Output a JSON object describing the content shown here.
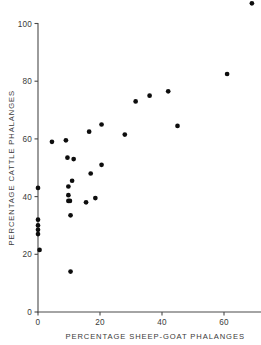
{
  "chart_data": {
    "type": "scatter",
    "title": "",
    "xlabel": "PERCENTAGE SHEEP-GOAT PHALANGES",
    "ylabel": "PERCENTAGE CATTLE PHALANGES",
    "xlim": [
      0,
      73
    ],
    "ylim": [
      0,
      110
    ],
    "xticks": [
      0,
      20,
      40,
      60
    ],
    "yticks": [
      0,
      20,
      40,
      60,
      80,
      100
    ],
    "xticklabels": [
      "0",
      "20",
      "40",
      "60"
    ],
    "yticklabels": [
      "0",
      "20",
      "40",
      "60",
      "80",
      "100"
    ],
    "grid": false,
    "legend": null,
    "marker": "filled-circle",
    "marker_color": "#0d0d0d",
    "points": [
      {
        "x": 0.0,
        "y": 43.0
      },
      {
        "x": 0.0,
        "y": 32.0
      },
      {
        "x": 0.0,
        "y": 30.0
      },
      {
        "x": 0.0,
        "y": 28.5
      },
      {
        "x": 0.0,
        "y": 27.0
      },
      {
        "x": 0.5,
        "y": 21.5
      },
      {
        "x": 4.5,
        "y": 59.0
      },
      {
        "x": 9.0,
        "y": 59.5
      },
      {
        "x": 9.5,
        "y": 53.5
      },
      {
        "x": 9.8,
        "y": 43.5
      },
      {
        "x": 9.8,
        "y": 40.5
      },
      {
        "x": 9.8,
        "y": 38.5
      },
      {
        "x": 10.3,
        "y": 38.5
      },
      {
        "x": 10.5,
        "y": 33.5
      },
      {
        "x": 10.5,
        "y": 14.0
      },
      {
        "x": 11.0,
        "y": 45.5
      },
      {
        "x": 11.5,
        "y": 53.0
      },
      {
        "x": 15.5,
        "y": 38.0
      },
      {
        "x": 16.5,
        "y": 62.5
      },
      {
        "x": 17.0,
        "y": 48.0
      },
      {
        "x": 18.5,
        "y": 39.5
      },
      {
        "x": 20.5,
        "y": 65.0
      },
      {
        "x": 20.5,
        "y": 51.0
      },
      {
        "x": 28.0,
        "y": 61.5
      },
      {
        "x": 31.5,
        "y": 73.0
      },
      {
        "x": 36.0,
        "y": 75.0
      },
      {
        "x": 42.0,
        "y": 76.5
      },
      {
        "x": 45.0,
        "y": 64.5
      },
      {
        "x": 61.0,
        "y": 82.5
      },
      {
        "x": 69.0,
        "y": 107.0
      }
    ]
  }
}
